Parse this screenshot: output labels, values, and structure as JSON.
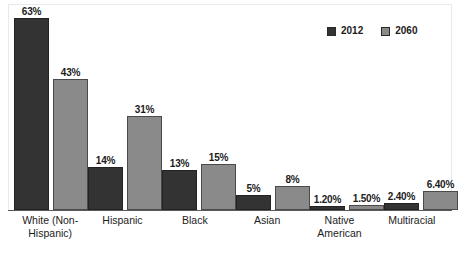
{
  "chart_data": {
    "type": "bar",
    "title": "",
    "subtitle": "",
    "xlabel": "",
    "ylabel": "",
    "ylim": [
      0,
      70
    ],
    "grid": false,
    "legend_position": "top-right",
    "categories": [
      "White (Non-Hispanic)",
      "Hispanic",
      "Black",
      "Asian",
      "Native American",
      "Multiracial"
    ],
    "category_lines": [
      [
        "White (Non-",
        "Hispanic)"
      ],
      [
        "Hispanic",
        ""
      ],
      [
        "Black",
        ""
      ],
      [
        "Asian",
        ""
      ],
      [
        "Native",
        "American"
      ],
      [
        "Multiracial",
        ""
      ]
    ],
    "series": [
      {
        "name": "2012",
        "color": "#333333",
        "values": [
          63,
          14,
          13,
          5,
          1.2,
          2.4
        ],
        "labels": [
          "63%",
          "14%",
          "13%",
          "5%",
          "1.20%",
          "2.40%"
        ]
      },
      {
        "name": "2060",
        "color": "#8a8a8a",
        "values": [
          43,
          31,
          15,
          8,
          1.5,
          6.4
        ],
        "labels": [
          "43%",
          "31%",
          "15%",
          "8%",
          "1.50%",
          "6.40%"
        ]
      }
    ]
  },
  "legend": {
    "items": [
      {
        "label": "2012",
        "color": "#333333"
      },
      {
        "label": "2060",
        "color": "#8a8a8a"
      }
    ]
  },
  "colors": {
    "series_2012": "#333333",
    "series_2060": "#8a8a8a",
    "axis": "#5a5a5a",
    "frame": "#e9e9e9",
    "text": "#1c1c1c",
    "background": "#ffffff"
  }
}
